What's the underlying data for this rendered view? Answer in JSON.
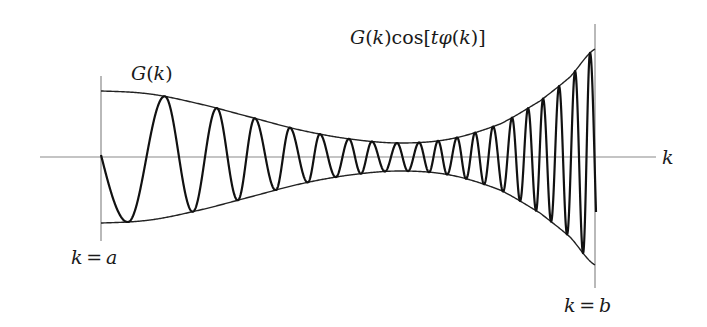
{
  "chart_data": {
    "type": "line",
    "xlabel": "k",
    "ylabel": "",
    "annotations": {
      "envelope_label": "G(k)",
      "function_label": "G(k)cos[tφ(k)]",
      "axis_label": "k",
      "left_bound_label": "k = a",
      "right_bound_label": "k = b"
    },
    "axis": {
      "y0": 157,
      "x_start": 40,
      "x_end": 656
    },
    "bounds": {
      "a": {
        "x": 101,
        "y_top": 76,
        "y_bottom": 241
      },
      "b": {
        "x": 595,
        "y_top": 24,
        "y_bottom": 288
      }
    },
    "envelope_halfwidth": {
      "x": [
        101,
        150,
        200,
        250,
        300,
        350,
        400,
        450,
        500,
        540,
        570,
        595
      ],
      "h": [
        66,
        63,
        53,
        40,
        27,
        18,
        14,
        18,
        33,
        56,
        80,
        108
      ]
    },
    "wave": {
      "start": {
        "x": 101,
        "y": 155
      },
      "extrema_x": [
        128,
        165,
        193,
        217,
        238,
        255,
        276,
        290,
        308,
        320,
        336,
        349,
        361,
        372,
        385,
        397,
        408,
        419,
        429,
        438,
        447,
        457,
        466,
        475,
        484,
        493,
        503,
        512,
        520,
        528,
        536,
        543,
        551,
        559,
        567,
        575,
        583,
        590
      ],
      "first_extremum": "trough",
      "end": {
        "x": 596,
        "y": 212
      }
    },
    "colors": {
      "axis": "#8a8a8a",
      "curve": "#111111",
      "envelope": "#222222"
    }
  },
  "labels": {
    "envelope": "G(k)",
    "function": "G(k)cos[tφ(k)]",
    "axis_k": "k",
    "k_equals_a": "k = a",
    "k_equals_b": "k = b"
  }
}
